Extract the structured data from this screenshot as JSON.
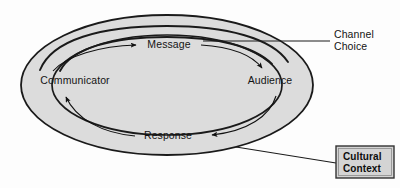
{
  "diagram": {
    "type": "cycle-diagram",
    "background_color": "#fdfdfd",
    "ellipse_fill": "#dcdcdc",
    "ellipse_stroke": "#1a1a1a",
    "text_color": "#141414",
    "nodes": [
      {
        "id": "communicator",
        "label": "Communicator",
        "x": 75,
        "y": 84
      },
      {
        "id": "audience",
        "label": "Audience",
        "x": 270,
        "y": 84
      },
      {
        "id": "message",
        "label": "Message",
        "x": 169,
        "y": 45
      },
      {
        "id": "response",
        "label": "Response",
        "x": 168,
        "y": 136
      }
    ],
    "callouts": [
      {
        "id": "channel-choice",
        "line1": "Channel",
        "line2": "Choice",
        "x": 334,
        "y1": 38,
        "y2": 50,
        "boxed": false
      },
      {
        "id": "cultural-context",
        "line1": "Cultural",
        "line2": "Context",
        "x": 343,
        "y1": 159,
        "y2": 172,
        "boxed": true,
        "box_fill": "#d4d4d4",
        "box_stroke": "#333333"
      }
    ],
    "flows": [
      {
        "id": "message-flow",
        "from": "communicator",
        "to": "audience",
        "label": "Message",
        "direction": "clockwise"
      },
      {
        "id": "response-flow",
        "from": "audience",
        "to": "communicator",
        "label": "Response",
        "direction": "counter-clockwise"
      }
    ]
  }
}
